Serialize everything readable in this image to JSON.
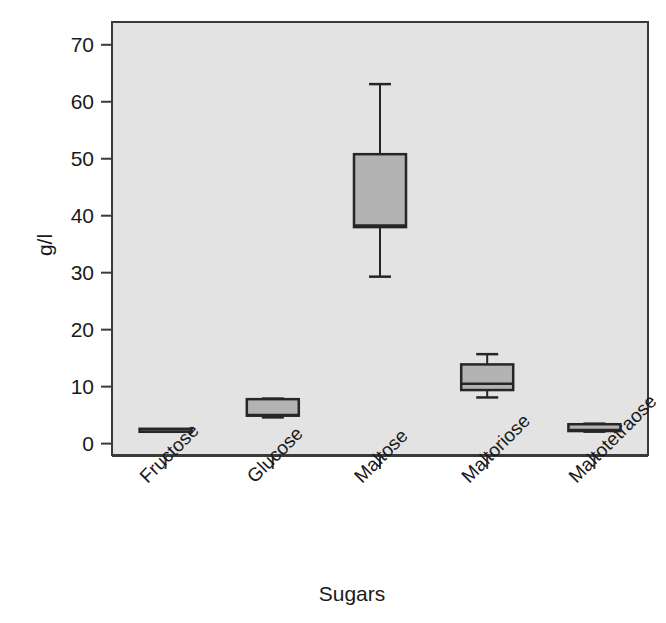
{
  "chart_data": {
    "type": "box",
    "title": "",
    "subtitle": "",
    "xlabel": "Sugars",
    "ylabel": "g/l",
    "categories": [
      "Fructose",
      "Glucose",
      "Maltose",
      "Maltoriose",
      "Maltotetraose"
    ],
    "ylim": [
      -2,
      74
    ],
    "y_ticks": [
      0,
      10,
      20,
      30,
      40,
      50,
      60,
      70
    ],
    "y_tick_labels": [
      "0",
      "10",
      "20",
      "30",
      "40",
      "50",
      "60",
      "70"
    ],
    "grid": false,
    "legend": null,
    "plot_background": "#e3e3e3",
    "box_fill": "#b3b3b3",
    "line_color": "#262626",
    "boxes": [
      {
        "category": "Fructose",
        "whisker_low": 2.4,
        "q1": 2.4,
        "median": 2.5,
        "q3": 2.6,
        "whisker_high": 2.6
      },
      {
        "category": "Glucose",
        "whisker_low": 4.6,
        "q1": 4.9,
        "median": 5.0,
        "q3": 7.8,
        "whisker_high": 7.9
      },
      {
        "category": "Maltose",
        "whisker_low": 29.3,
        "q1": 38.0,
        "median": 38.3,
        "q3": 50.8,
        "whisker_high": 63.1
      },
      {
        "category": "Maltoriose",
        "whisker_low": 8.1,
        "q1": 9.4,
        "median": 10.5,
        "q3": 13.9,
        "whisker_high": 15.7
      },
      {
        "category": "Maltotetraose",
        "whisker_low": 2.1,
        "q1": 2.2,
        "median": 2.4,
        "q3": 3.4,
        "whisker_high": 3.5
      }
    ]
  },
  "axes": {
    "y_axis_label": "g/l",
    "x_axis_label": "Sugars",
    "y_tick_labels": [
      "70",
      "60",
      "50",
      "40",
      "30",
      "20",
      "10",
      "0"
    ],
    "x_tick_labels": [
      "Fructose",
      "Glucose",
      "Maltose",
      "Maltoriose",
      "Maltotetraose"
    ]
  }
}
